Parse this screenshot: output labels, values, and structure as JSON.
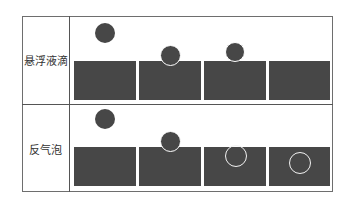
{
  "rows": [
    {
      "label": "悬浮液滴",
      "stages": [
        {
          "state": "droplet-above-surface"
        },
        {
          "state": "droplet-touching-surface"
        },
        {
          "state": "droplet-resting-on-surface"
        },
        {
          "state": "droplet-merged"
        }
      ]
    },
    {
      "label": "反气泡",
      "stages": [
        {
          "state": "droplet-above-surface"
        },
        {
          "state": "droplet-touching-surface"
        },
        {
          "state": "antibubble-just-below-surface"
        },
        {
          "state": "antibubble-sinking"
        }
      ]
    }
  ],
  "colors": {
    "liquid": "#474747",
    "droplet": "#474747",
    "film_outline": "#ffffff",
    "border": "#555555"
  }
}
